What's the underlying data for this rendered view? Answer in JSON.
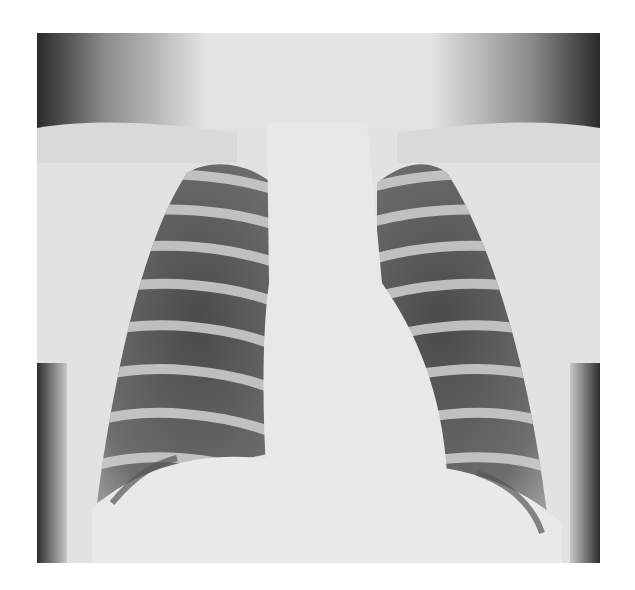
{
  "image": {
    "subject": "chest radiograph (PA view)",
    "alt": "Frontal chest X-ray showing ribs, lung fields, mediastinum, heart shadow and diaphragm",
    "colors": {
      "background": "#ffffff",
      "soft_tissue": "#e6e6e6",
      "air_dark": "#2a2a2a",
      "lung": "#5a5a5a",
      "bone": "#d8d8d8"
    }
  }
}
